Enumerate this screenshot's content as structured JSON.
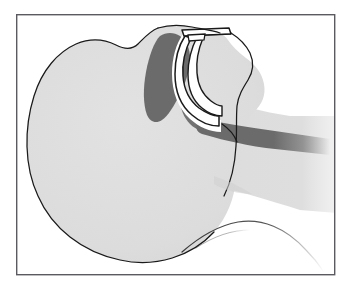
{
  "figure": {
    "type": "medical-line-illustration",
    "width_px": 350,
    "height_px": 286,
    "background_color": "#ffffff",
    "caption": ""
  },
  "frame": {
    "name": "illustration-border",
    "x": 16,
    "y": 14,
    "width": 319,
    "height": 261,
    "stroke_color": "#5a5a60",
    "stroke_width": 1.4,
    "fill_color": "#ffffff"
  },
  "palette": {
    "outline": "#1a1a1a",
    "head_fill": "#dcdcdc",
    "head_fill_light": "#e4e4e4",
    "soft_tissue_dark": "#6b6b6b",
    "airway_stripe": "#6b6b6b",
    "device_fill": "#ffffff",
    "device_outline": "#1a1a1a",
    "shadow": "#b9b9b9",
    "frame": "#5a5a60"
  },
  "anatomy": {
    "parts": [
      {
        "id": "head-silhouette",
        "label": "Head and face profile",
        "fill": "#dcdcdc",
        "outline": "#1a1a1a",
        "description": "Large rounded cranium at left with facial profile at right, chin and neck descending to lower right"
      },
      {
        "id": "tongue-soft-palate",
        "label": "Tongue and soft palate",
        "fill": "#6b6b6b",
        "description": "Dark crescent mass behind the device, curving from the palate down into the oropharynx"
      },
      {
        "id": "pharyngeal-airway",
        "label": "Pharyngeal airway passage",
        "fill": "#6b6b6b",
        "description": "Dark band extending posteriorly from the oropharynx toward the right edge, fading out"
      },
      {
        "id": "epiglottis",
        "label": "Epiglottis and laryngeal inlet",
        "fill": "#6b6b6b",
        "description": "Small hook shaped structure at the inferior tip of the device"
      },
      {
        "id": "shoulder-contour",
        "label": "Shoulder and chest contour",
        "outline": "#3a3a3a",
        "description": "Fine arcing line across the lower right, fading toward the right edge"
      }
    ]
  },
  "device": {
    "id": "airway-device",
    "label": "Oropharyngeal airway",
    "fill": "#ffffff",
    "outline": "#1a1a1a",
    "components": [
      {
        "id": "device-flange",
        "label": "External flange / bite block"
      },
      {
        "id": "device-shaft",
        "label": "Curved tube shaft"
      },
      {
        "id": "device-tip",
        "label": "Distal tip at hypopharynx"
      }
    ]
  },
  "labels": {
    "callouts": []
  }
}
